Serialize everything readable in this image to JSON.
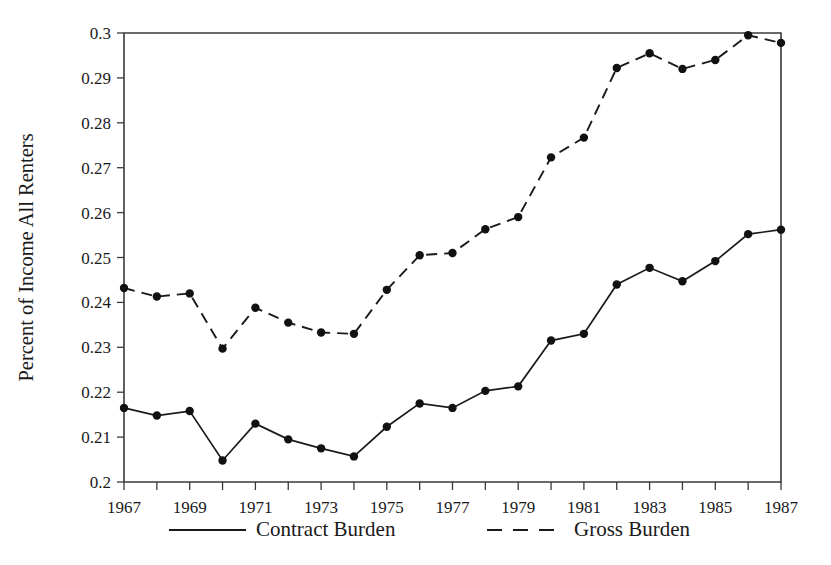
{
  "chart_data": {
    "type": "line",
    "title": "",
    "xlabel": "",
    "ylabel": "Percent of Income All Renters",
    "xlim": [
      1967,
      1987
    ],
    "ylim": [
      0.2,
      0.3
    ],
    "grid": false,
    "legend_position": "below-axes",
    "x": [
      1967,
      1968,
      1969,
      1970,
      1971,
      1972,
      1973,
      1974,
      1975,
      1976,
      1977,
      1978,
      1979,
      1980,
      1981,
      1982,
      1983,
      1984,
      1985,
      1986,
      1987
    ],
    "x_tick_labels": [
      "1967",
      "1969",
      "1971",
      "1973",
      "1975",
      "1977",
      "1979",
      "1981",
      "1983",
      "1985",
      "1987"
    ],
    "x_tick_values": [
      1967,
      1969,
      1971,
      1973,
      1975,
      1977,
      1979,
      1981,
      1983,
      1985,
      1987
    ],
    "y_tick_labels": [
      "0.2",
      "0.21",
      "0.22",
      "0.23",
      "0.24",
      "0.25",
      "0.26",
      "0.27",
      "0.28",
      "0.29",
      "0.3"
    ],
    "y_tick_values": [
      0.2,
      0.21,
      0.22,
      0.23,
      0.24,
      0.25,
      0.26,
      0.27,
      0.28,
      0.29,
      0.3
    ],
    "series": [
      {
        "name": "Contract Burden",
        "style": "solid",
        "color": "#1a1a1a",
        "marker": "circle",
        "values": [
          0.2165,
          0.2148,
          0.2158,
          0.2048,
          0.213,
          0.2095,
          0.2075,
          0.2057,
          0.2123,
          0.2175,
          0.2165,
          0.2203,
          0.2213,
          0.2315,
          0.233,
          0.244,
          0.2477,
          0.2447,
          0.2492,
          0.2552,
          0.2562
        ]
      },
      {
        "name": "Gross Burden",
        "style": "dashed",
        "color": "#1a1a1a",
        "marker": "circle",
        "values": [
          0.2432,
          0.2413,
          0.242,
          0.2297,
          0.2388,
          0.2355,
          0.2333,
          0.233,
          0.2428,
          0.2505,
          0.251,
          0.2563,
          0.259,
          0.2723,
          0.2767,
          0.2922,
          0.2955,
          0.292,
          0.294,
          0.2995,
          0.2978
        ]
      }
    ]
  },
  "legend": {
    "items": [
      {
        "label": "Contract Burden",
        "style": "solid"
      },
      {
        "label": "Gross Burden",
        "style": "dashed"
      }
    ]
  }
}
